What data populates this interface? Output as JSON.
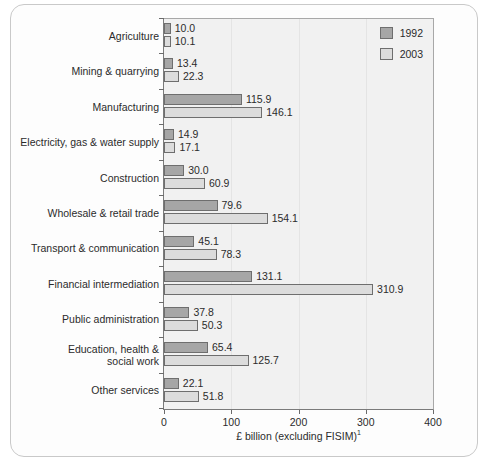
{
  "chart_data": {
    "type": "bar",
    "orientation": "horizontal",
    "title": "",
    "xlabel": "£ billion (excluding FISIM)",
    "xlabel_superscript": "1",
    "ylabel": "",
    "xlim": [
      0,
      400
    ],
    "xticks": [
      0,
      100,
      200,
      300,
      400
    ],
    "xtick_labels": [
      "0",
      "100",
      "200",
      "300",
      "400"
    ],
    "grid": true,
    "legend_position": "top-right",
    "categories": [
      "Agriculture",
      "Mining & quarrying",
      "Manufacturing",
      "Electricity, gas & water supply",
      "Construction",
      "Wholesale & retail trade",
      "Transport & communication",
      "Financial intermediation",
      "Public administration",
      "Education, health & social work",
      "Other services"
    ],
    "series": [
      {
        "name": "1992",
        "color": "#a6a6a6",
        "values": [
          10.0,
          13.4,
          115.9,
          14.9,
          30.0,
          79.6,
          45.1,
          131.1,
          37.8,
          65.4,
          22.1
        ],
        "value_labels": [
          "10.0",
          "13.4",
          "115.9",
          "14.9",
          "30.0",
          "79.6",
          "45.1",
          "131.1",
          "37.8",
          "65.4",
          "22.1"
        ]
      },
      {
        "name": "2003",
        "color": "#dcdcdc",
        "values": [
          10.1,
          22.3,
          146.1,
          17.1,
          60.9,
          154.1,
          78.3,
          310.9,
          50.3,
          125.7,
          51.8
        ],
        "value_labels": [
          "10.1",
          "22.3",
          "146.1",
          "17.1",
          "60.9",
          "154.1",
          "78.3",
          "310.9",
          "50.3",
          "125.7",
          "51.8"
        ]
      }
    ]
  },
  "legend": {
    "items": [
      {
        "label": "1992",
        "color": "#a6a6a6"
      },
      {
        "label": "2003",
        "color": "#dcdcdc"
      }
    ]
  },
  "caption": {
    "text": ""
  }
}
